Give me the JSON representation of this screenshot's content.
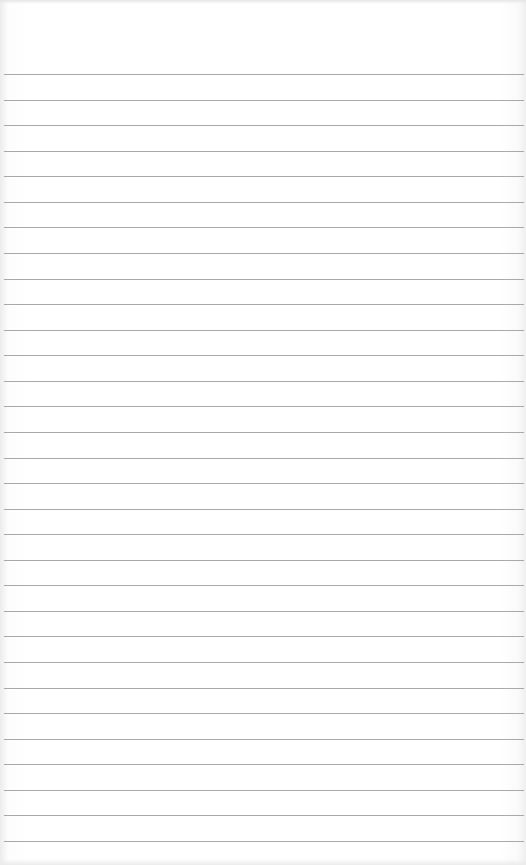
{
  "image": {
    "subject": "blank lined notebook paper",
    "paper_color": "#ffffff",
    "rule_color": "#a9a9a9",
    "rule_count": 31
  }
}
